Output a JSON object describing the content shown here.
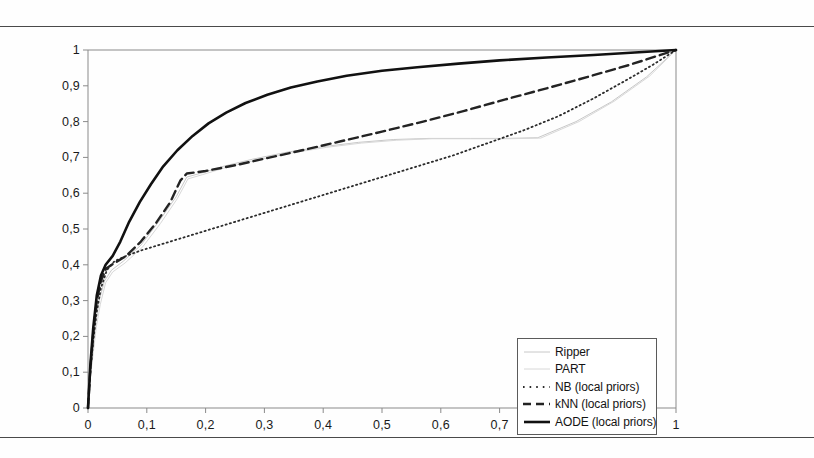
{
  "chart_data": {
    "type": "line",
    "title": "",
    "xlabel": "",
    "ylabel": "",
    "xlim": [
      0,
      1
    ],
    "ylim": [
      0,
      1
    ],
    "grid": false,
    "legend_position": "lower right",
    "x_tick_labels": [
      "0",
      "0,1",
      "0,2",
      "0,3",
      "0,4",
      "0,5",
      "0,6",
      "0,7",
      "0,8",
      "0,9",
      "1"
    ],
    "y_tick_labels": [
      "0",
      "0,1",
      "0,2",
      "0,3",
      "0,4",
      "0,5",
      "0,6",
      "0,7",
      "0,8",
      "0,9",
      "1"
    ],
    "x_ticks": [
      0,
      0.1,
      0.2,
      0.3,
      0.4,
      0.5,
      0.6,
      0.7,
      0.8,
      0.9,
      1
    ],
    "y_ticks": [
      0,
      0.1,
      0.2,
      0.3,
      0.4,
      0.5,
      0.6,
      0.7,
      0.8,
      0.9,
      1
    ],
    "series": [
      {
        "name": "Ripper",
        "style": "solid-light",
        "color": "#c8c8c8",
        "width": 1,
        "points": [
          [
            0,
            0
          ],
          [
            0.004,
            0.09
          ],
          [
            0.008,
            0.16
          ],
          [
            0.013,
            0.235
          ],
          [
            0.019,
            0.3
          ],
          [
            0.028,
            0.355
          ],
          [
            0.04,
            0.385
          ],
          [
            0.06,
            0.41
          ],
          [
            0.09,
            0.455
          ],
          [
            0.12,
            0.52
          ],
          [
            0.15,
            0.59
          ],
          [
            0.168,
            0.645
          ],
          [
            0.19,
            0.655
          ],
          [
            0.23,
            0.675
          ],
          [
            0.28,
            0.695
          ],
          [
            0.34,
            0.715
          ],
          [
            0.4,
            0.73
          ],
          [
            0.46,
            0.742
          ],
          [
            0.52,
            0.75
          ],
          [
            0.58,
            0.753
          ],
          [
            0.65,
            0.753
          ],
          [
            0.71,
            0.753
          ],
          [
            0.765,
            0.755
          ],
          [
            0.83,
            0.8
          ],
          [
            0.89,
            0.855
          ],
          [
            0.95,
            0.925
          ],
          [
            1,
            1
          ]
        ]
      },
      {
        "name": "PART",
        "style": "solid-verylight",
        "color": "#d8d8d8",
        "width": 1,
        "points": [
          [
            0,
            0
          ],
          [
            0.004,
            0.085
          ],
          [
            0.009,
            0.155
          ],
          [
            0.014,
            0.225
          ],
          [
            0.021,
            0.29
          ],
          [
            0.03,
            0.35
          ],
          [
            0.042,
            0.38
          ],
          [
            0.063,
            0.405
          ],
          [
            0.093,
            0.45
          ],
          [
            0.123,
            0.515
          ],
          [
            0.152,
            0.585
          ],
          [
            0.17,
            0.64
          ],
          [
            0.195,
            0.652
          ],
          [
            0.235,
            0.672
          ],
          [
            0.285,
            0.692
          ],
          [
            0.345,
            0.712
          ],
          [
            0.405,
            0.728
          ],
          [
            0.465,
            0.74
          ],
          [
            0.525,
            0.748
          ],
          [
            0.585,
            0.752
          ],
          [
            0.655,
            0.752
          ],
          [
            0.715,
            0.752
          ],
          [
            0.77,
            0.754
          ],
          [
            0.835,
            0.8
          ],
          [
            0.895,
            0.857
          ],
          [
            0.955,
            0.927
          ],
          [
            1,
            1
          ]
        ]
      },
      {
        "name": "NB (local priors)",
        "style": "dotted",
        "color": "#2b2b2b",
        "width": 1.8,
        "points": [
          [
            0,
            0
          ],
          [
            0.004,
            0.1
          ],
          [
            0.009,
            0.19
          ],
          [
            0.015,
            0.27
          ],
          [
            0.022,
            0.335
          ],
          [
            0.032,
            0.385
          ],
          [
            0.045,
            0.41
          ],
          [
            0.065,
            0.425
          ],
          [
            0.09,
            0.44
          ],
          [
            0.12,
            0.455
          ],
          [
            0.16,
            0.475
          ],
          [
            0.21,
            0.5
          ],
          [
            0.26,
            0.525
          ],
          [
            0.32,
            0.555
          ],
          [
            0.38,
            0.585
          ],
          [
            0.44,
            0.615
          ],
          [
            0.5,
            0.645
          ],
          [
            0.56,
            0.675
          ],
          [
            0.62,
            0.705
          ],
          [
            0.68,
            0.74
          ],
          [
            0.74,
            0.775
          ],
          [
            0.8,
            0.815
          ],
          [
            0.86,
            0.865
          ],
          [
            0.92,
            0.92
          ],
          [
            0.96,
            0.958
          ],
          [
            1,
            1
          ]
        ]
      },
      {
        "name": "kNN (local priors)",
        "style": "dashed",
        "color": "#232323",
        "width": 2.4,
        "points": [
          [
            0,
            0
          ],
          [
            0.004,
            0.11
          ],
          [
            0.009,
            0.21
          ],
          [
            0.015,
            0.3
          ],
          [
            0.022,
            0.355
          ],
          [
            0.031,
            0.39
          ],
          [
            0.045,
            0.405
          ],
          [
            0.065,
            0.425
          ],
          [
            0.09,
            0.465
          ],
          [
            0.115,
            0.515
          ],
          [
            0.14,
            0.575
          ],
          [
            0.157,
            0.635
          ],
          [
            0.168,
            0.655
          ],
          [
            0.2,
            0.662
          ],
          [
            0.25,
            0.678
          ],
          [
            0.31,
            0.7
          ],
          [
            0.37,
            0.722
          ],
          [
            0.43,
            0.745
          ],
          [
            0.5,
            0.772
          ],
          [
            0.57,
            0.8
          ],
          [
            0.64,
            0.83
          ],
          [
            0.71,
            0.862
          ],
          [
            0.78,
            0.893
          ],
          [
            0.85,
            0.925
          ],
          [
            0.92,
            0.958
          ],
          [
            1,
            1
          ]
        ]
      },
      {
        "name": "AODE (local priors)",
        "style": "solid-bold",
        "color": "#111111",
        "width": 2.6,
        "points": [
          [
            0,
            0
          ],
          [
            0.004,
            0.12
          ],
          [
            0.009,
            0.225
          ],
          [
            0.015,
            0.315
          ],
          [
            0.022,
            0.37
          ],
          [
            0.03,
            0.4
          ],
          [
            0.042,
            0.425
          ],
          [
            0.055,
            0.465
          ],
          [
            0.07,
            0.52
          ],
          [
            0.088,
            0.575
          ],
          [
            0.107,
            0.625
          ],
          [
            0.128,
            0.675
          ],
          [
            0.152,
            0.72
          ],
          [
            0.178,
            0.76
          ],
          [
            0.205,
            0.795
          ],
          [
            0.235,
            0.825
          ],
          [
            0.268,
            0.852
          ],
          [
            0.305,
            0.875
          ],
          [
            0.345,
            0.895
          ],
          [
            0.39,
            0.912
          ],
          [
            0.44,
            0.928
          ],
          [
            0.5,
            0.942
          ],
          [
            0.56,
            0.952
          ],
          [
            0.63,
            0.962
          ],
          [
            0.7,
            0.971
          ],
          [
            0.78,
            0.979
          ],
          [
            0.86,
            0.986
          ],
          [
            0.93,
            0.993
          ],
          [
            1,
            1
          ]
        ]
      }
    ]
  },
  "legend": {
    "items": [
      {
        "label": "Ripper",
        "swatch": "solid-light"
      },
      {
        "label": "PART",
        "swatch": "solid-verylight"
      },
      {
        "label": "NB (local priors)",
        "swatch": "dotted"
      },
      {
        "label": "kNN (local priors)",
        "swatch": "dashed"
      },
      {
        "label": "AODE (local priors)",
        "swatch": "solid-bold"
      }
    ]
  },
  "colors": {
    "frame": "#8a8a8a",
    "rule": "#4a4a4a",
    "text": "#1a1a1a",
    "background": "#fefefe"
  }
}
